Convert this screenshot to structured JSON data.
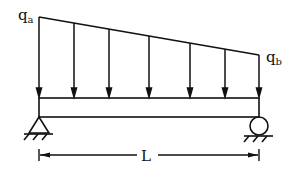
{
  "diagram": {
    "type": "simply-supported beam with linearly varying distributed load",
    "labels": {
      "q_left": "q",
      "q_left_sub": "a",
      "q_right": "q",
      "q_right_sub": "b",
      "span": "L"
    },
    "load": {
      "start": {
        "x": 39,
        "y": 17
      },
      "end": {
        "x": 259,
        "y": 55
      },
      "arrow_x": [
        39,
        74,
        109,
        149,
        190,
        225,
        259
      ],
      "arrow_tip_y": 97
    },
    "beam": {
      "x1": 39,
      "x2": 259,
      "top_y": 98,
      "bottom_y": 117
    },
    "supports": {
      "left": {
        "kind": "pin",
        "x": 39,
        "y": 117
      },
      "right": {
        "kind": "roller",
        "x": 259,
        "y": 117
      }
    },
    "dimension": {
      "y": 155,
      "x1": 39,
      "x2": 259
    },
    "colors": {
      "stroke": "#111111",
      "background": "#ffffff"
    }
  }
}
